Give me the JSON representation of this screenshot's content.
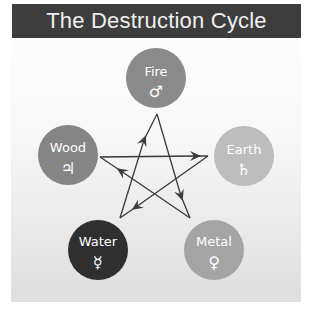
{
  "title": "The Destruction Cycle",
  "elements": [
    {
      "id": "fire",
      "label": "Fire",
      "symbol": "♂",
      "symbol_name": "mars-icon",
      "color": "#8a8a8a",
      "cx": 156,
      "cy": 78
    },
    {
      "id": "earth",
      "label": "Earth",
      "symbol": "♄",
      "symbol_name": "saturn-icon",
      "color": "#bdbdbd",
      "cx": 244,
      "cy": 156
    },
    {
      "id": "metal",
      "label": "Metal",
      "symbol": "♀",
      "symbol_name": "venus-icon",
      "color": "#a4a4a4",
      "cx": 214,
      "cy": 250
    },
    {
      "id": "water",
      "label": "Water",
      "symbol": "☿",
      "symbol_name": "mercury-icon",
      "color": "#2f2f2f",
      "cx": 98,
      "cy": 250
    },
    {
      "id": "wood",
      "label": "Wood",
      "symbol": "♃",
      "symbol_name": "jupiter-icon",
      "color": "#858585",
      "cx": 68,
      "cy": 155
    }
  ],
  "relations": [
    {
      "from": "Water",
      "to": "Fire"
    },
    {
      "from": "Fire",
      "to": "Metal"
    },
    {
      "from": "Metal",
      "to": "Wood"
    },
    {
      "from": "Wood",
      "to": "Earth"
    },
    {
      "from": "Earth",
      "to": "Water"
    }
  ],
  "colors": {
    "title_bg": "#3d3d3d",
    "title_text": "#f0f0f0",
    "line": "#3a3a3a"
  }
}
